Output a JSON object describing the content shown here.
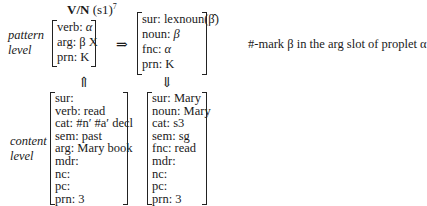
{
  "title": {
    "rule_name": "V/N",
    "rule_arg": "(s1)",
    "superscript": "7"
  },
  "pattern_level": {
    "label_line1": "pattern",
    "label_line2": "level",
    "input": [
      {
        "attr": "verb:",
        "value": "α"
      },
      {
        "attr": "arg:",
        "value": "β X"
      },
      {
        "attr": "prn:",
        "value": "K"
      }
    ],
    "arrow": "⇒",
    "output": [
      {
        "attr": "sur:",
        "value": "lexnoun(β̂)"
      },
      {
        "attr": "noun:",
        "value": "β"
      },
      {
        "attr": "fnc:",
        "value": "α"
      },
      {
        "attr": "prn:",
        "value": "K"
      }
    ],
    "annotation": "#-mark β in the arg slot of proplet α"
  },
  "arrows": {
    "up": "⇑",
    "down": "⇓"
  },
  "content_level": {
    "label_line1": "content",
    "label_line2": "level",
    "input": [
      {
        "attr": "sur:",
        "value": ""
      },
      {
        "attr": "verb:",
        "value": "read"
      },
      {
        "attr": "cat:",
        "value": "#n′ #a′ decl"
      },
      {
        "attr": "sem:",
        "value": "past"
      },
      {
        "attr": "arg:",
        "value": "Mary book"
      },
      {
        "attr": "mdr:",
        "value": ""
      },
      {
        "attr": "nc:",
        "value": ""
      },
      {
        "attr": "pc:",
        "value": ""
      },
      {
        "attr": "prn:",
        "value": "3"
      }
    ],
    "output": [
      {
        "attr": "sur:",
        "value": "Mary"
      },
      {
        "attr": "noun:",
        "value": "Mary"
      },
      {
        "attr": "cat:",
        "value": "s3"
      },
      {
        "attr": "sem:",
        "value": "sg"
      },
      {
        "attr": "fnc:",
        "value": "read"
      },
      {
        "attr": "mdr:",
        "value": ""
      },
      {
        "attr": "nc:",
        "value": ""
      },
      {
        "attr": "pc:",
        "value": ""
      },
      {
        "attr": "prn:",
        "value": "3"
      }
    ]
  }
}
